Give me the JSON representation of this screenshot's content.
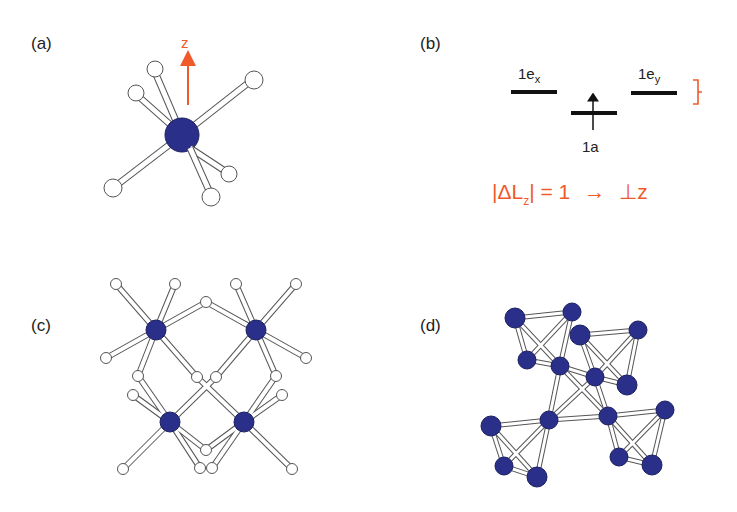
{
  "figure": {
    "panels": [
      {
        "id": "a",
        "label": "(a)",
        "axis_label": "z"
      },
      {
        "id": "b",
        "label": "(b)",
        "levels": [
          {
            "name": "1e",
            "subscript": "x"
          },
          {
            "name": "1a",
            "subscript": ""
          },
          {
            "name": "1e",
            "subscript": "y"
          }
        ],
        "selection_rule": {
          "lhs_open": "|ΔL",
          "lhs_sub": "z",
          "lhs_close": "| = 1",
          "arrow": "→",
          "rhs": "⊥z"
        }
      },
      {
        "id": "c",
        "label": "(c)"
      },
      {
        "id": "d",
        "label": "(d)"
      }
    ],
    "colors": {
      "metal_atom": "#2a2f8a",
      "ligand_atom": "#ffffff",
      "bond_outline": "#555555",
      "accent": "#f05a28",
      "text": "#222222"
    }
  }
}
